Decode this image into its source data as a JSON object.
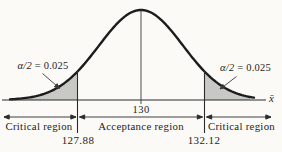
{
  "figure": {
    "type": "normal-distribution-two-tailed-test",
    "mean": 130,
    "critical_value_left": 127.88,
    "critical_value_right": 132.12,
    "alpha_per_tail": 0.025,
    "colors": {
      "background": "#fbfaf6",
      "curve": "#1c1c1c",
      "shade": "#c8c8c5",
      "ink": "#2b2b2b"
    }
  },
  "labels": {
    "alpha_symbol": "α/2",
    "alpha_value": "= 0.025",
    "mean": "130",
    "critical_left": "127.88",
    "critical_right": "132.12",
    "region_left": "Critical region",
    "region_center": "Acceptance region",
    "region_right": "Critical region",
    "axis_symbol": "x̄"
  }
}
